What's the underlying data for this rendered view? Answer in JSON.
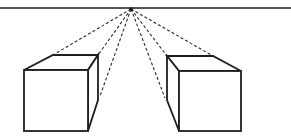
{
  "diagram": {
    "type": "one-point-perspective",
    "title": "",
    "colors": {
      "stroke": "#1e1e1e",
      "background": "#ffffff"
    },
    "horizon": {
      "y": 8,
      "x1": 0,
      "x2": 291
    },
    "vanishing_point": {
      "x": 131,
      "y": 9
    },
    "cubes": [
      {
        "name": "left-cube",
        "front_face": {
          "x1": 24,
          "y1": 70,
          "x2": 88,
          "y2": 131
        },
        "back_top_left": {
          "x": 53,
          "y": 55
        },
        "back_top_right": {
          "x": 98,
          "y": 55
        },
        "back_bottom_right": {
          "x": 98,
          "y": 100
        }
      },
      {
        "name": "right-cube",
        "front_face": {
          "x1": 179,
          "y1": 71,
          "x2": 241,
          "y2": 131
        },
        "back_top_left": {
          "x": 167,
          "y": 56
        },
        "back_top_right": {
          "x": 213,
          "y": 56
        },
        "back_bottom_left": {
          "x": 167,
          "y": 100
        }
      }
    ],
    "projection_lines": [
      {
        "to_x": 53,
        "to_y": 55
      },
      {
        "to_x": 98,
        "to_y": 55
      },
      {
        "to_x": 100,
        "to_y": 96
      },
      {
        "to_x": 167,
        "to_y": 56
      },
      {
        "to_x": 165,
        "to_y": 98
      },
      {
        "to_x": 213,
        "to_y": 56
      }
    ]
  }
}
